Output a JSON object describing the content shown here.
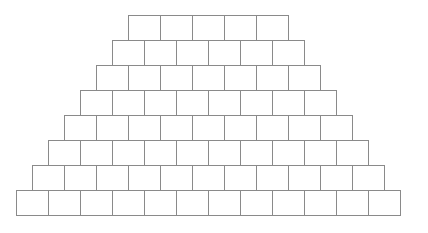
{
  "figure": {
    "background_color": "#ffffff",
    "brick_fill_color": "#ffffff",
    "brick_stroke_color": "#8a8a8a",
    "brick_stroke_width": 1
  },
  "geometry": {
    "canvas_width": 428,
    "canvas_height": 233,
    "brick_width": 32,
    "brick_height": 25,
    "row_offset_step": 16,
    "top_row_left": 128,
    "top_row_top": 15,
    "bottom_row_left": 16,
    "bottom_row_top": 190
  },
  "chart_data": {
    "type": "bar",
    "xlabel": "",
    "ylabel": "Bricks per course",
    "categories": [
      "Course 1 (top)",
      "Course 2",
      "Course 3",
      "Course 4",
      "Course 5",
      "Course 6",
      "Course 7",
      "Course 8 (bottom)"
    ],
    "values": [
      5,
      6,
      7,
      8,
      9,
      10,
      11,
      12
    ],
    "ylim": [
      0,
      12
    ],
    "grid": false,
    "legend": "none",
    "total_bricks": 68
  },
  "rows": [
    {
      "index": 0,
      "name": "course-1",
      "count": 5,
      "left": 128,
      "top": 15
    },
    {
      "index": 1,
      "name": "course-2",
      "count": 6,
      "left": 112,
      "top": 40
    },
    {
      "index": 2,
      "name": "course-3",
      "count": 7,
      "left": 96,
      "top": 65
    },
    {
      "index": 3,
      "name": "course-4",
      "count": 8,
      "left": 80,
      "top": 90
    },
    {
      "index": 4,
      "name": "course-5",
      "count": 9,
      "left": 64,
      "top": 115
    },
    {
      "index": 5,
      "name": "course-6",
      "count": 10,
      "left": 48,
      "top": 140
    },
    {
      "index": 6,
      "name": "course-7",
      "count": 11,
      "left": 32,
      "top": 165
    },
    {
      "index": 7,
      "name": "course-8",
      "count": 12,
      "left": 16,
      "top": 190
    }
  ]
}
